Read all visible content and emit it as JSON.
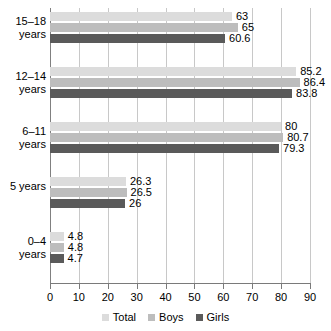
{
  "chart_data": {
    "type": "bar",
    "orientation": "horizontal",
    "title": "",
    "xlabel": "",
    "ylabel": "",
    "xlim": [
      0,
      90
    ],
    "xticks": [
      0,
      10,
      20,
      30,
      40,
      50,
      60,
      70,
      80,
      90
    ],
    "grid": true,
    "legend_position": "bottom-center",
    "categories": [
      "15–18\nyears",
      "12–14\nyears",
      "6–11\nyears",
      "5 years",
      "0–4\nyears"
    ],
    "series": [
      {
        "name": "Total",
        "color": "#dcdcdc",
        "values": [
          63,
          85.2,
          80,
          26.3,
          4.8
        ],
        "labels": [
          "63",
          "85.2",
          "80",
          "26.3",
          "4.8"
        ]
      },
      {
        "name": "Boys",
        "color": "#bdbdbd",
        "values": [
          65,
          86.4,
          80.7,
          26.5,
          4.8
        ],
        "labels": [
          "65",
          "86.4",
          "80.7",
          "26.5",
          "4.8"
        ]
      },
      {
        "name": "Girls",
        "color": "#5a5a5a",
        "values": [
          60.6,
          83.8,
          79.3,
          26,
          4.7
        ],
        "labels": [
          "60.6",
          "83.8",
          "79.3",
          "26",
          "4.7"
        ]
      }
    ]
  },
  "axis": {
    "tick_labels": [
      "0",
      "10",
      "20",
      "30",
      "40",
      "50",
      "60",
      "70",
      "80",
      "90"
    ]
  },
  "legend": {
    "items": [
      {
        "label": "Total",
        "swatch": "total"
      },
      {
        "label": "Boys",
        "swatch": "boys"
      },
      {
        "label": "Girls",
        "swatch": "girls"
      }
    ]
  }
}
